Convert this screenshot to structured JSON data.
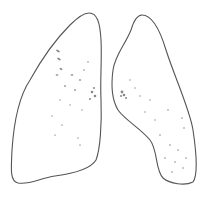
{
  "illustration": {
    "subject": "lungs-line-drawing",
    "stroke_color": "#555555",
    "marking_color": "#8a8a8a",
    "background": "#ffffff"
  }
}
